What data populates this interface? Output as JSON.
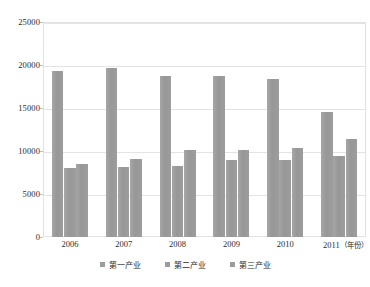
{
  "chart_data": {
    "type": "bar",
    "title": "",
    "xlabel": "年份",
    "ylabel": "",
    "categories": [
      "2006",
      "2007",
      "2008",
      "2009",
      "2010",
      "2011"
    ],
    "series": [
      {
        "name": "第一产业",
        "values": [
          19300,
          19700,
          18700,
          18700,
          18400,
          14500
        ]
      },
      {
        "name": "第二产业",
        "values": [
          8000,
          8100,
          8300,
          9000,
          9000,
          9400
        ]
      },
      {
        "name": "第三产业",
        "values": [
          8500,
          9100,
          10100,
          10100,
          10400,
          11400
        ]
      }
    ],
    "ylim": [
      0,
      25000
    ],
    "yticks": [
      0,
      5000,
      10000,
      15000,
      20000,
      25000
    ],
    "ytick_labels": [
      "0",
      "5000",
      "10000",
      "15000",
      "20000",
      "25000"
    ],
    "xtick_labels": [
      "2006",
      "2007",
      "2008",
      "2009",
      "2010",
      "2011"
    ],
    "x_axis_unit_label": "（年份）",
    "grid": true,
    "legend_position": "bottom",
    "bar_color": "#9c9c9c",
    "gridline_color": "#e4e4e4",
    "plot_border_color": "#e2e2e2"
  },
  "legend": {
    "items": [
      {
        "label": "第一产业"
      },
      {
        "label": "第二产业"
      },
      {
        "label": "第三产业"
      }
    ]
  }
}
